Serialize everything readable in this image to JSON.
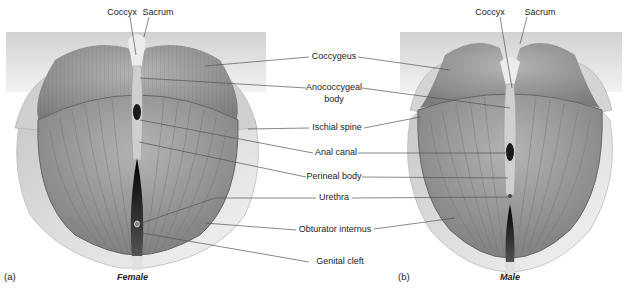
{
  "figure": {
    "panels": [
      {
        "id": "a",
        "panel_label": "(a)",
        "caption": "Female"
      },
      {
        "id": "b",
        "panel_label": "(b)",
        "caption": "Male"
      }
    ],
    "top_labels": {
      "female": {
        "coccyx": "Coccyx",
        "sacrum": "Sacrum"
      },
      "male": {
        "coccyx": "Coccyx",
        "sacrum": "Sacrum"
      }
    },
    "center_labels": [
      {
        "key": "coccygeus",
        "text": "Coccygeus"
      },
      {
        "key": "anococcygeal_body_1",
        "text": "Anococcygeal"
      },
      {
        "key": "anococcygeal_body_2",
        "text": "body"
      },
      {
        "key": "ischial_spine",
        "text": "Ischial spine"
      },
      {
        "key": "anal_canal",
        "text": "Anal canal"
      },
      {
        "key": "perineal_body",
        "text": "Perineal body"
      },
      {
        "key": "urethra",
        "text": "Urethra"
      },
      {
        "key": "obturator_internus",
        "text": "Obturator internus"
      },
      {
        "key": "genital_cleft",
        "text": "Genital cleft"
      }
    ],
    "colors": {
      "muscle": "#9a9a9a",
      "muscle_dark": "#6e6e6e",
      "bone": "#e6e6e6",
      "background_panel": "#dcdcdc",
      "leader_line": "#555555",
      "opening": "#111111"
    }
  }
}
